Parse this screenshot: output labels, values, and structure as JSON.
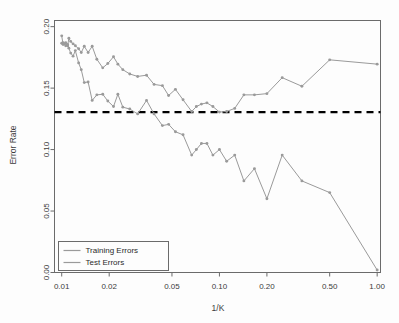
{
  "chart_data": {
    "type": "line",
    "title": "",
    "xlabel": "1/K",
    "ylabel": "Error Rate",
    "xscale": "log",
    "xlim": [
      0.009,
      1.05
    ],
    "ylim": [
      0.0,
      0.205
    ],
    "grid": false,
    "legend_position": "bottom-left",
    "xticks": [
      0.01,
      0.02,
      0.05,
      0.1,
      0.2,
      0.5,
      1.0
    ],
    "xticklabels": [
      "0.01",
      "0.02",
      "0.05",
      "0.10",
      "0.20",
      "0.50",
      "1.00"
    ],
    "yticks": [
      0.0,
      0.05,
      0.1,
      0.15,
      0.2
    ],
    "yticklabels": [
      "0.00",
      "0.05",
      "0.10",
      "0.15",
      "0.20"
    ],
    "annotations": [
      {
        "name": "bayes-error-rate",
        "type": "hline",
        "y": 0.1304,
        "style": "dashed",
        "color": "#000000",
        "label": ""
      }
    ],
    "series": [
      {
        "name": "Training Errors",
        "color": "#9a9a9a",
        "marker": "dot",
        "x": [
          0.01,
          0.0102,
          0.0104,
          0.0106,
          0.0109,
          0.0111,
          0.0114,
          0.0118,
          0.0122,
          0.0128,
          0.0133,
          0.0139,
          0.0147,
          0.0156,
          0.0167,
          0.0182,
          0.0196,
          0.0213,
          0.0227,
          0.0244,
          0.027,
          0.0303,
          0.0345,
          0.0385,
          0.0435,
          0.0476,
          0.0526,
          0.0588,
          0.0667,
          0.0714,
          0.0769,
          0.0833,
          0.0909,
          0.1,
          0.1111,
          0.125,
          0.1429,
          0.1667,
          0.2,
          0.25,
          0.3333,
          0.5,
          1.0
        ],
        "y": [
          0.1865,
          0.187,
          0.186,
          0.1845,
          0.1855,
          0.1825,
          0.1785,
          0.176,
          0.1805,
          0.1705,
          0.165,
          0.1545,
          0.155,
          0.14,
          0.1445,
          0.145,
          0.1395,
          0.135,
          0.145,
          0.1345,
          0.133,
          0.129,
          0.14,
          0.129,
          0.1195,
          0.1205,
          0.1145,
          0.112,
          0.0955,
          0.1,
          0.105,
          0.105,
          0.0955,
          0.1,
          0.0905,
          0.0955,
          0.0745,
          0.0845,
          0.06,
          0.0955,
          0.0745,
          0.065,
          0.002
        ]
      },
      {
        "name": "Test Errors",
        "color": "#9a9a9a",
        "marker": "dot",
        "x": [
          0.01,
          0.0102,
          0.0104,
          0.0106,
          0.0109,
          0.0111,
          0.0114,
          0.0118,
          0.0122,
          0.0128,
          0.0133,
          0.0139,
          0.0147,
          0.0156,
          0.0167,
          0.0182,
          0.0196,
          0.0213,
          0.0227,
          0.0244,
          0.027,
          0.0303,
          0.0345,
          0.0385,
          0.0435,
          0.0476,
          0.0526,
          0.0588,
          0.0667,
          0.0714,
          0.0769,
          0.0833,
          0.0909,
          0.1,
          0.1111,
          0.125,
          0.1429,
          0.1667,
          0.2,
          0.25,
          0.3333,
          0.5,
          1.0
        ],
        "y": [
          0.1925,
          0.1855,
          0.186,
          0.187,
          0.1845,
          0.1905,
          0.188,
          0.186,
          0.1845,
          0.182,
          0.179,
          0.184,
          0.179,
          0.184,
          0.1735,
          0.1665,
          0.17,
          0.1755,
          0.1695,
          0.165,
          0.1615,
          0.1595,
          0.1605,
          0.153,
          0.152,
          0.144,
          0.149,
          0.1405,
          0.131,
          0.135,
          0.137,
          0.138,
          0.135,
          0.1305,
          0.131,
          0.1335,
          0.1445,
          0.1445,
          0.1455,
          0.1585,
          0.1515,
          0.173,
          0.1695
        ]
      }
    ]
  },
  "legend": {
    "entries": [
      {
        "label": "Training Errors"
      },
      {
        "label": "Test Errors"
      }
    ]
  },
  "axes": {
    "x_title": "1/K",
    "y_title": "Error Rate"
  }
}
